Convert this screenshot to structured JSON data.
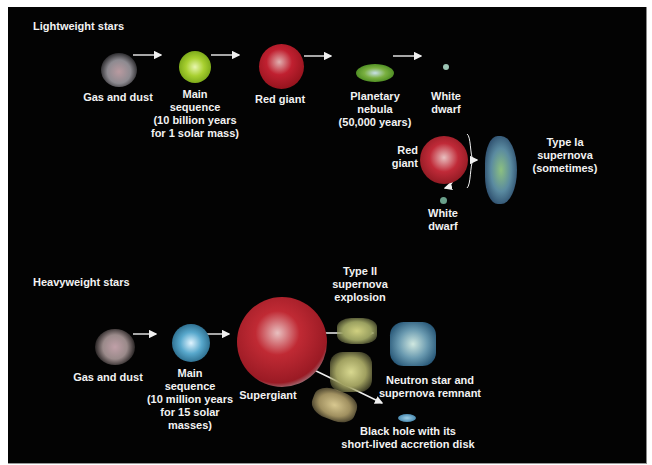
{
  "lightweight": {
    "title": "Lightweight stars",
    "stages": [
      {
        "label_lines": [
          "Gas and dust"
        ]
      },
      {
        "label_lines": [
          "Main",
          "sequence",
          "(10 billion years",
          "for 1 solar mass)"
        ]
      },
      {
        "label_lines": [
          "Red giant"
        ]
      },
      {
        "label_lines": [
          "Planetary",
          "nebula",
          "(50,000 years)"
        ]
      },
      {
        "label_lines": [
          "White",
          "dwarf"
        ]
      }
    ],
    "binary": {
      "red_giant": [
        "Red",
        "giant"
      ],
      "white_dwarf": [
        "White",
        "dwarf"
      ],
      "supernova": [
        "Type Ia",
        "supernova",
        "(sometimes)"
      ]
    }
  },
  "heavyweight": {
    "title": "Heavyweight stars",
    "stages": [
      {
        "label_lines": [
          "Gas and dust"
        ]
      },
      {
        "label_lines": [
          "Main",
          "sequence",
          "(10 million years",
          "for 15 solar",
          "masses)"
        ]
      },
      {
        "label_lines": [
          "Supergiant"
        ]
      },
      {
        "label_lines": [
          "Type II",
          "supernova",
          "explosion"
        ]
      },
      {
        "label_lines": [
          "Neutron star and",
          "supernova remnant"
        ]
      },
      {
        "label_lines": [
          "Black hole with its",
          "short-lived accretion disk"
        ]
      }
    ]
  },
  "colors": {
    "background": "#030303",
    "text": "#f2f2f2",
    "main_sequence_light": "#9ccc2a",
    "red_giant": "#b01820",
    "main_sequence_heavy": "#4aa3c8",
    "white_dwarf": "#8fb8a8"
  }
}
